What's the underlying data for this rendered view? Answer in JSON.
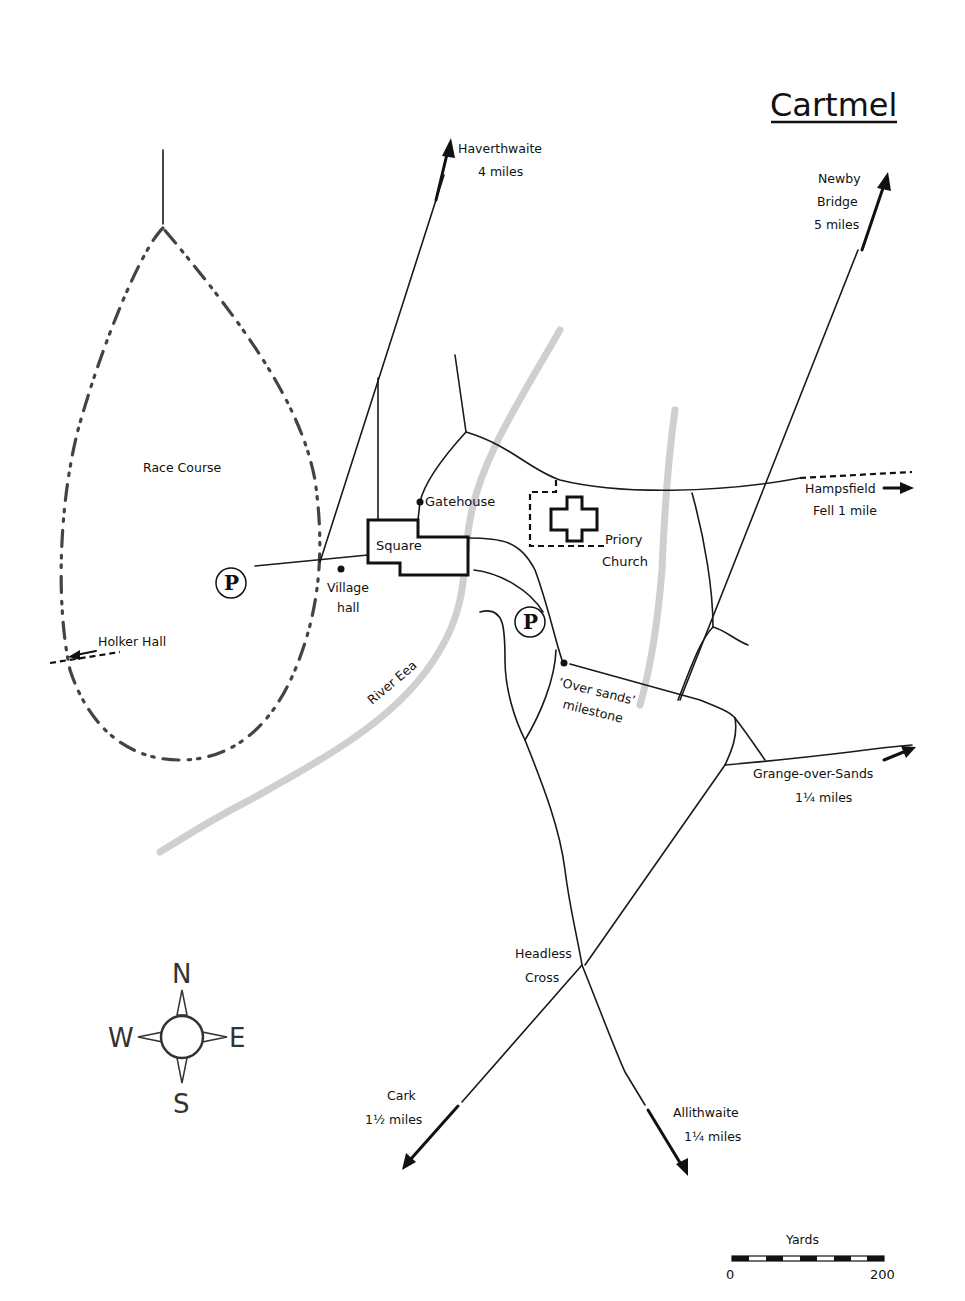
{
  "title": "Cartmel",
  "directions": {
    "haverthwaite": {
      "name": "Haverthwaite",
      "distance": "4 miles"
    },
    "newby_bridge": {
      "name_line1": "Newby",
      "name_line2": "Bridge",
      "distance": "5 miles"
    },
    "hampsfield": {
      "name": "Hampsfield",
      "distance": "Fell 1 mile"
    },
    "grange": {
      "name": "Grange-over-Sands",
      "distance": "1¼ miles"
    },
    "cark": {
      "name": "Cark",
      "distance": "1½ miles"
    },
    "allithwaite": {
      "name": "Allithwaite",
      "distance": "1¼ miles"
    },
    "holker": {
      "name": "Holker Hall"
    }
  },
  "places": {
    "race_course": "Race Course",
    "square": "Square",
    "gatehouse": "Gatehouse",
    "priory_line1": "Priory",
    "priory_line2": "Church",
    "village_hall_line1": "Village",
    "village_hall_line2": "hall",
    "river": "River Eea",
    "milestone_line1": "‘Over sands’",
    "milestone_line2": "milestone",
    "headless_line1": "Headless",
    "headless_line2": "Cross"
  },
  "parking": {
    "symbol": "P"
  },
  "compass": {
    "n": "N",
    "e": "E",
    "s": "S",
    "w": "W"
  },
  "scale": {
    "unit": "Yards",
    "min": "0",
    "max": "200"
  },
  "colors": {
    "ink": "#111111",
    "river": "#cfcfcf",
    "race_course": "#444444",
    "background": "#ffffff"
  }
}
